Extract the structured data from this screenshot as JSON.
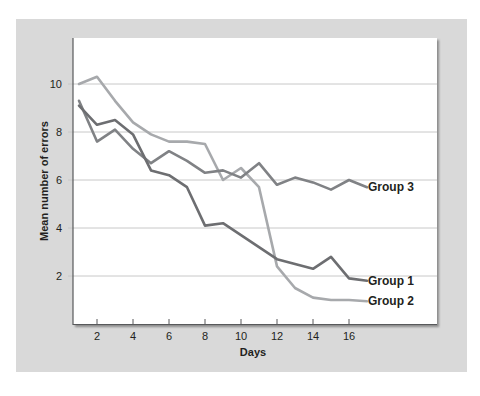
{
  "chart_data": {
    "type": "line",
    "title": "",
    "xlabel": "Days",
    "ylabel": "Mean number of errors",
    "x": [
      1,
      2,
      3,
      4,
      5,
      6,
      7,
      8,
      9,
      10,
      11,
      12,
      13,
      14,
      15,
      16,
      17
    ],
    "xticks": [
      "2",
      "4",
      "6",
      "8",
      "10",
      "12",
      "14",
      "16"
    ],
    "yticks": [
      "2",
      "4",
      "6",
      "8",
      "10"
    ],
    "xlim": [
      0,
      20
    ],
    "ylim": [
      0,
      12
    ],
    "grid": "horizontal",
    "legend_position": "inline-right",
    "series": [
      {
        "name": "Group 1",
        "color": "#6d6e71",
        "values": [
          9.1,
          8.3,
          8.5,
          7.9,
          6.4,
          6.2,
          5.7,
          4.1,
          4.2,
          3.7,
          3.2,
          2.7,
          2.5,
          2.3,
          2.8,
          1.9,
          1.8
        ]
      },
      {
        "name": "Group 2",
        "color": "#a7a9ac",
        "values": [
          10.0,
          10.3,
          9.3,
          8.4,
          7.9,
          7.6,
          7.6,
          7.5,
          6.0,
          6.5,
          5.7,
          2.4,
          1.5,
          1.1,
          1.0,
          1.0,
          0.95
        ]
      },
      {
        "name": "Group 3",
        "color": "#808285",
        "values": [
          9.3,
          7.6,
          8.1,
          7.3,
          6.7,
          7.2,
          6.8,
          6.3,
          6.4,
          6.1,
          6.7,
          5.8,
          6.1,
          5.9,
          5.6,
          6.0,
          5.7
        ]
      }
    ]
  },
  "labels": {
    "xlabel": "Days",
    "ylabel": "Mean number of errors",
    "group1": "Group 1",
    "group2": "Group 2",
    "group3": "Group 3"
  },
  "colors": {
    "panel": "#d9d9d9",
    "plot_bg": "#ffffff",
    "gridline": "#c8c8c8",
    "axis": "#58595b"
  }
}
